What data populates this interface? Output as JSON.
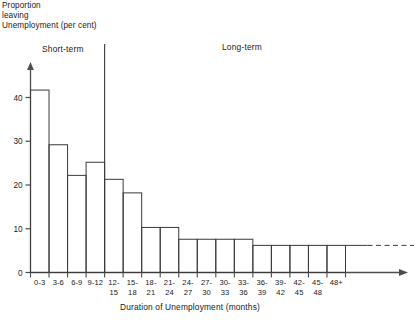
{
  "chart_data": {
    "type": "bar",
    "title": "",
    "ylabel": "Proportion leaving Unemployment (per cent)",
    "xlabel": "Duration of Unemployment (months)",
    "ylim": [
      0,
      45
    ],
    "yticks": [
      0,
      10,
      20,
      30,
      40
    ],
    "ytick_labels": [
      "0",
      "10",
      "20",
      "30",
      "40"
    ],
    "grid": false,
    "legend": "none",
    "categories": [
      "0-3",
      "3-6",
      "6-9",
      "9-12",
      "12-15",
      "15-18",
      "18-21",
      "21-24",
      "24-27",
      "27-30",
      "30-33",
      "33-36",
      "36-39",
      "39-42",
      "42-45",
      "45-48",
      "48+"
    ],
    "category_lines": [
      [
        "0-3"
      ],
      [
        "3-6"
      ],
      [
        "6-9"
      ],
      [
        "9-12"
      ],
      [
        "12-",
        "15"
      ],
      [
        "15-",
        "18"
      ],
      [
        "18-",
        "21"
      ],
      [
        "21-",
        "24"
      ],
      [
        "24-",
        "27"
      ],
      [
        "27-",
        "30"
      ],
      [
        "30-",
        "33"
      ],
      [
        "33-",
        "36"
      ],
      [
        "36-",
        "39"
      ],
      [
        "39-",
        "42"
      ],
      [
        "42-",
        "45"
      ],
      [
        "45-",
        "48"
      ],
      [
        "48+"
      ]
    ],
    "values": [
      41.7,
      29.2,
      22.2,
      25.2,
      21.3,
      18.2,
      10.3,
      10.3,
      7.6,
      7.6,
      7.6,
      7.6,
      6.2,
      6.2,
      6.2,
      6.2,
      6.2
    ],
    "annotations": [
      {
        "text": "Short-term",
        "x_category_start": "0-3",
        "x_category_end": "9-12"
      },
      {
        "text": "Long-term",
        "x_category_start": "12-15",
        "x_category_end": "48+"
      }
    ],
    "divider": {
      "after_category": "9-12",
      "style": "solid-vertical"
    },
    "tail": {
      "style": "dashed",
      "from_category": "48+",
      "value": 6.2
    }
  },
  "labels": {
    "ylabel_line1": "Proportion",
    "ylabel_line2": "leaving",
    "ylabel_line3": "Unemployment (per cent)",
    "short_term": "Short-term",
    "long_term": "Long-term",
    "xtitle": "Duration of Unemployment (months)"
  },
  "colors": {
    "axis": "#4d4d4d",
    "bar_outline": "#3a3a3a",
    "text": "#1a1a1a",
    "background": "#ffffff"
  }
}
